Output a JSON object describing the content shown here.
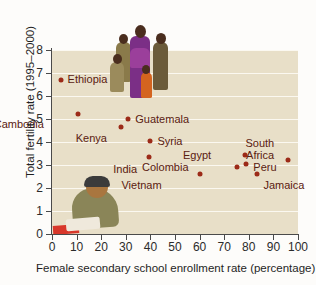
{
  "chart_data": {
    "type": "scatter",
    "title": "",
    "xlabel": "Female secondary school enrollment rate (percentage)",
    "ylabel": "Total fertility rate (1995–2000)",
    "xlim": [
      0,
      100
    ],
    "ylim": [
      0,
      8
    ],
    "xticks": [
      0,
      10,
      20,
      30,
      40,
      50,
      60,
      70,
      80,
      90,
      100
    ],
    "yticks": [
      0,
      1,
      2,
      3,
      4,
      5,
      6,
      7,
      8
    ],
    "grid": "horizontal",
    "legend": "none",
    "marker_color": "#9c2a18",
    "plot_background": "#e8dfc8",
    "points": [
      {
        "label": "Ethiopia",
        "x": 3.5,
        "y": 6.7,
        "label_dx": 7,
        "label_dy": -6
      },
      {
        "label": "Cambodia",
        "x": 10.5,
        "y": 5.2,
        "label_dx": -34,
        "label_dy": 5
      },
      {
        "label": "Kenya",
        "x": 28,
        "y": 4.65,
        "label_dx": -14,
        "label_dy": 6
      },
      {
        "label": "Guatemala",
        "x": 31,
        "y": 5.0,
        "label_dx": 7,
        "label_dy": -5
      },
      {
        "label": "Syria",
        "x": 40,
        "y": 4.05,
        "label_dx": 7,
        "label_dy": -5
      },
      {
        "label": "India",
        "x": 39.5,
        "y": 3.35,
        "label_dx": -12,
        "label_dy": 7
      },
      {
        "label": "Vietnam",
        "x": 60,
        "y": 2.6,
        "label_dx": -38,
        "label_dy": 6
      },
      {
        "label": "Colombia",
        "x": 75,
        "y": 2.9,
        "label_dx": -48,
        "label_dy": -5
      },
      {
        "label": "Egypt",
        "x": 78.5,
        "y": 3.45,
        "label_dx": -34,
        "label_dy": -5
      },
      {
        "label": "Peru",
        "x": 79,
        "y": 3.05,
        "label_dx": 7,
        "label_dy": -2
      },
      {
        "label": "Jamaica",
        "x": 83.5,
        "y": 2.6,
        "label_dx": 6,
        "label_dy": 6
      },
      {
        "label": "South Africa",
        "x": 96,
        "y": 3.2,
        "label_dx": -14,
        "label_dy": -22
      }
    ]
  },
  "figure": {
    "photo_family_alt": "family-photo",
    "photo_reader_alt": "woman-reading-photo"
  }
}
